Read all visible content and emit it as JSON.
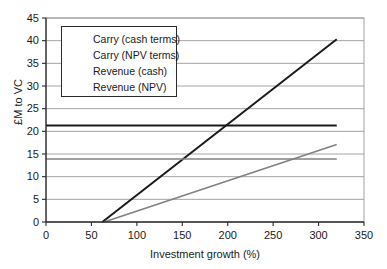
{
  "chart_data": {
    "type": "line",
    "title": "",
    "xlabel": "Investment growth (%)",
    "ylabel": "£M to VC",
    "xlim": [
      0,
      350
    ],
    "ylim": [
      0,
      45
    ],
    "xticks": [
      0,
      50,
      100,
      150,
      200,
      250,
      300,
      350
    ],
    "yticks": [
      0,
      5,
      10,
      15,
      20,
      25,
      30,
      35,
      40,
      45
    ],
    "grid": "horizontal",
    "legend_position": "upper-left-inside",
    "series": [
      {
        "name": "Carry (cash terms)",
        "color": "#1a1a1a",
        "width": 2,
        "points": [
          [
            62,
            0
          ],
          [
            320,
            40.3
          ]
        ]
      },
      {
        "name": "Carry (NPV terms)",
        "color": "#808080",
        "width": 1.6,
        "points": [
          [
            64,
            0
          ],
          [
            320,
            17.1
          ]
        ]
      },
      {
        "name": "Revenue (cash)",
        "color": "#1a1a1a",
        "width": 2,
        "points": [
          [
            0,
            21.3
          ],
          [
            320,
            21.3
          ]
        ]
      },
      {
        "name": "Revenue (NPV)",
        "color": "#808080",
        "width": 1.6,
        "points": [
          [
            0,
            13.9
          ],
          [
            320,
            13.9
          ]
        ]
      }
    ],
    "annotations": [
      "Carry (cash terms) crosses Revenue (cash) at approximately 200% investment growth",
      "Carry (NPV terms) crosses Revenue (NPV) at approximately 300% investment growth"
    ]
  },
  "colors": {
    "dark_line": "#1a1a1a",
    "gray_line": "#808080",
    "gridline": "#9a9a9a",
    "axis": "#2b2b2b",
    "background": "#ffffff"
  }
}
